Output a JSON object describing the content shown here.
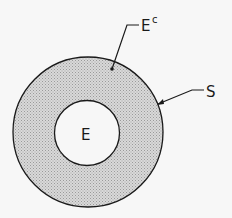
{
  "diagram": {
    "type": "venn",
    "regions": [
      {
        "id": "S",
        "label": "S",
        "role": "sample space (outer circle boundary)"
      },
      {
        "id": "E",
        "label": "E",
        "role": "event (inner circle, unshaded)"
      },
      {
        "id": "Ec",
        "label": "E",
        "superscript": "c",
        "role": "complement of E (shaded annulus)"
      }
    ],
    "colors": {
      "background": "#f7f7f7",
      "shaded_region": "#c8c8c8",
      "stroke": "#1a1a1a"
    }
  }
}
